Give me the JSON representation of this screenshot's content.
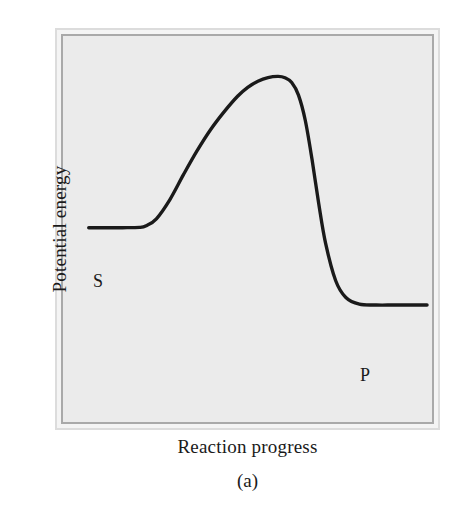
{
  "figure": {
    "caption": "(a)",
    "y_axis_title": "Potential energy",
    "x_axis_title": "Reaction progress",
    "background_color": "#ffffff",
    "plot_background_color": "#ebebeb",
    "frame_outer_color": "#dcdcdc",
    "frame_inner_color": "#a9a9a9",
    "curve_color": "#1a1a1a"
  },
  "labels": {
    "substrate": "S",
    "product": "P"
  },
  "chart_data": {
    "type": "line",
    "title": "",
    "subtitle": "",
    "xlabel": "Reaction progress",
    "ylabel": "Potential energy",
    "legend": [],
    "grid": false,
    "axis_ticks": false,
    "xlim": [
      0,
      1
    ],
    "ylim": [
      0,
      1
    ],
    "annotations": [
      {
        "text": "S",
        "meaning": "substrate ground state (reactant plateau)",
        "x": 0.04,
        "y": 0.41
      },
      {
        "text": "P",
        "meaning": "product ground state (product plateau)",
        "x": 0.82,
        "y": 0.11
      },
      {
        "text": "(a)",
        "meaning": "figure panel caption",
        "x": 0.5,
        "y": -0.14
      }
    ],
    "series": [
      {
        "name": "uncatalyzed reaction energy profile",
        "x": [
          0.0,
          0.05,
          0.1,
          0.15,
          0.17,
          0.2,
          0.24,
          0.28,
          0.32,
          0.36,
          0.4,
          0.44,
          0.47,
          0.5,
          0.53,
          0.56,
          0.58,
          0.6,
          0.62,
          0.64,
          0.66,
          0.68,
          0.7,
          0.73,
          0.76,
          0.8,
          0.85,
          0.9,
          0.95,
          1.0
        ],
        "y": [
          0.455,
          0.455,
          0.455,
          0.456,
          0.462,
          0.487,
          0.556,
          0.645,
          0.73,
          0.806,
          0.87,
          0.926,
          0.958,
          0.98,
          0.993,
          0.997,
          0.992,
          0.975,
          0.93,
          0.84,
          0.7,
          0.54,
          0.4,
          0.265,
          0.205,
          0.181,
          0.178,
          0.178,
          0.178,
          0.178
        ]
      }
    ]
  }
}
